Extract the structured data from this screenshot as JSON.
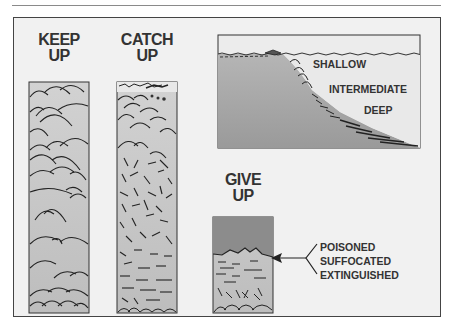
{
  "figure": {
    "columns": [
      {
        "id": "keep-up",
        "label_line1": "KEEP",
        "label_line2": "UP"
      },
      {
        "id": "catch-up",
        "label_line1": "CATCH",
        "label_line2": "UP"
      },
      {
        "id": "give-up",
        "label_line1": "GIVE",
        "label_line2": "UP"
      }
    ],
    "inset": {
      "depth_labels": [
        "SHALLOW",
        "INTERMEDIATE",
        "DEEP"
      ]
    },
    "give_up_causes": [
      "POISONED",
      "SUFFOCATED",
      "EXTINGUISHED"
    ],
    "colors": {
      "frame_bg": "#f1f1f1",
      "column_fill": "#c9c9c9",
      "dark_water": "#8c8c8c",
      "line": "#2a2a2a",
      "text": "#333333"
    }
  }
}
